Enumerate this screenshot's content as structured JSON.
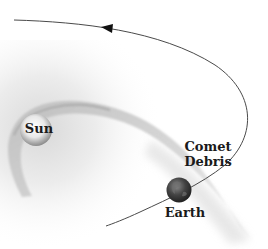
{
  "diagram": {
    "title": "",
    "labels": {
      "sun": "Sun",
      "comet_line1": "Comet",
      "comet_line2": "Debris",
      "earth": "Earth"
    },
    "elements": [
      {
        "id": "sun",
        "type": "body",
        "label": "Sun"
      },
      {
        "id": "earth",
        "type": "body",
        "label": "Earth"
      },
      {
        "id": "comet-orbit",
        "type": "orbit-path",
        "direction": "counter-clockwise (arrow points left along top)"
      },
      {
        "id": "comet-debris",
        "type": "debris-trail",
        "label": "Comet Debris"
      },
      {
        "id": "earth-orbit",
        "type": "orbit-path"
      }
    ],
    "colors": {
      "background": "#ffffff",
      "orbit_line": "#4a4a4a",
      "sun_center": "#ffffff",
      "sun_edge": "#8c8c8c",
      "earth": "#3a3a3a",
      "debris": "#c8c8c8",
      "text": "#1a1a1a"
    }
  }
}
